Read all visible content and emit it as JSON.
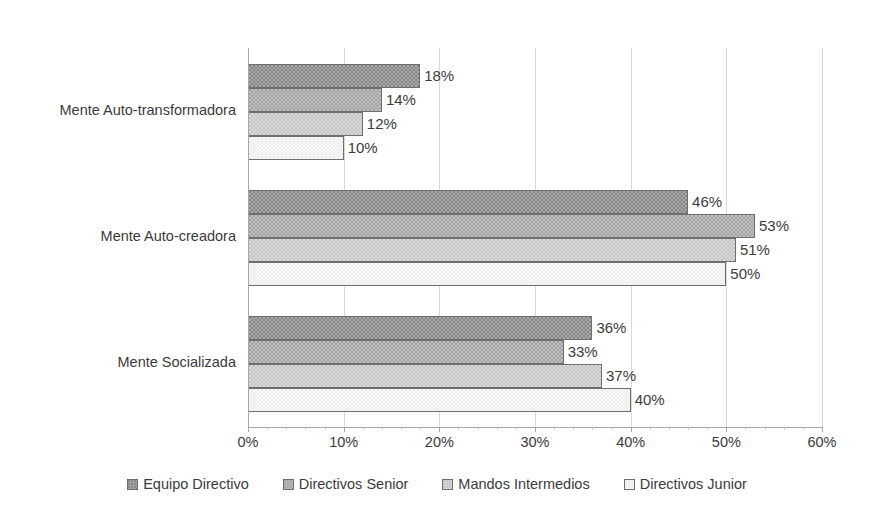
{
  "chart_data": {
    "type": "bar",
    "orientation": "horizontal",
    "title": "",
    "xlabel": "",
    "ylabel": "",
    "xlim": [
      0,
      60
    ],
    "xtick_labels": [
      "0%",
      "10%",
      "20%",
      "30%",
      "40%",
      "50%",
      "60%"
    ],
    "xtick_values": [
      0,
      10,
      20,
      30,
      40,
      50,
      60
    ],
    "grid": true,
    "legend_position": "bottom",
    "categories": [
      "Mente Auto-transformadora",
      "Mente Auto-creadora",
      "Mente Socializada"
    ],
    "series": [
      {
        "name": "Equipo Directivo",
        "color": "#878787",
        "values": [
          18,
          46,
          36
        ],
        "labels": [
          "18%",
          "46%",
          "36%"
        ]
      },
      {
        "name": "Directivos Senior",
        "color": "#a3a3a3",
        "values": [
          14,
          53,
          33
        ],
        "labels": [
          "14%",
          "53%",
          "33%"
        ]
      },
      {
        "name": "Mandos Intermedios",
        "color": "#c4c4c4",
        "values": [
          12,
          51,
          37
        ],
        "labels": [
          "12%",
          "51%",
          "37%"
        ]
      },
      {
        "name": "Directivos Junior",
        "color": "#ededed",
        "values": [
          10,
          50,
          40
        ],
        "labels": [
          "10%",
          "50%",
          "40%"
        ]
      }
    ]
  },
  "axis": {
    "gridline_color": "#d9d9d9",
    "axis_color": "#a6a6a6"
  }
}
